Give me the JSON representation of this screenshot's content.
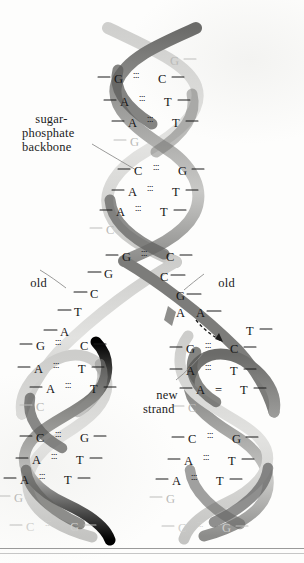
{
  "figure": {
    "type": "biology-diagram",
    "background_color": "#fdfdfc",
    "ink_color": "#161616"
  },
  "callouts": [
    {
      "id": "sugar-phosphate-backbone",
      "text": "sugar-\nphosphate\nbackbone",
      "x": 22,
      "y": 104
    },
    {
      "id": "old-left",
      "text": "old",
      "x": 17,
      "y": 268
    },
    {
      "id": "old-right",
      "text": "old",
      "x": 205,
      "y": 268
    },
    {
      "id": "new-strand",
      "text": "new\nstrand",
      "x": 143,
      "y": 381
    }
  ],
  "strands": {
    "light_label": "old strand (light ribbon)",
    "dark_label": "old strand (dark ribbon)",
    "light_color": "#c8c8c6",
    "dark_color": "#6e6e6c",
    "mid_color": "#9a9a98",
    "new_color": "#8a8a88"
  },
  "parent_duplex": {
    "region": "unreplicated double helix (top)",
    "pairs": [
      {
        "left": "",
        "right": "G",
        "y": 62,
        "bond": "dots",
        "style": "faded"
      },
      {
        "left": "G",
        "right": "C",
        "y": 80,
        "bond": "dots",
        "style": "normal"
      },
      {
        "left": "A",
        "right": "T",
        "y": 103,
        "bond": "dots",
        "style": "normal"
      },
      {
        "left": "A",
        "right": "T",
        "y": 124,
        "bond": "dots",
        "style": "normal"
      },
      {
        "left": "G",
        "right": "",
        "y": 143,
        "bond": "none",
        "style": "faded"
      },
      {
        "left": "C",
        "right": "G",
        "y": 172,
        "bond": "dots",
        "style": "normal"
      },
      {
        "left": "A",
        "right": "T",
        "y": 193,
        "bond": "dots",
        "style": "normal"
      },
      {
        "left": "A",
        "right": "T",
        "y": 213,
        "bond": "dots",
        "style": "normal"
      },
      {
        "left": "C",
        "right": "",
        "y": 231,
        "bond": "none",
        "style": "faded"
      },
      {
        "left": "G",
        "right": "C",
        "y": 258,
        "bond": "dots",
        "style": "normal"
      }
    ]
  },
  "unwound_left": {
    "region": "unwound template strand (left, old)",
    "bases": [
      {
        "base": "G",
        "y": 275
      },
      {
        "base": "C",
        "y": 295
      },
      {
        "base": "T",
        "y": 313
      },
      {
        "base": "A",
        "y": 333
      }
    ]
  },
  "unwound_right": {
    "region": "unwound template strand (right, old)",
    "bases": [
      {
        "base": "C",
        "y": 278
      },
      {
        "base": "G",
        "y": 297
      },
      {
        "base": "A",
        "y": 314
      }
    ]
  },
  "free_nucleotide": {
    "base": "A",
    "label": "free nucleotide being added",
    "x": 196,
    "y": 314,
    "arrow": "dashed-curved-arrow"
  },
  "daughter_left": {
    "region": "left daughter duplex",
    "pairs": [
      {
        "left": "G",
        "right": "C",
        "y": 347,
        "bond": "dots",
        "style": "normal"
      },
      {
        "left": "A",
        "right": "T",
        "y": 370,
        "bond": "dots",
        "style": "normal"
      },
      {
        "left": "A",
        "right": "T",
        "y": 390,
        "bond": "dots",
        "style": "normal"
      },
      {
        "left": "C",
        "right": "",
        "y": 408,
        "bond": "none",
        "style": "faded"
      },
      {
        "left": "C",
        "right": "G",
        "y": 439,
        "bond": "dots",
        "style": "normal"
      },
      {
        "left": "A",
        "right": "T",
        "y": 461,
        "bond": "dots",
        "style": "normal"
      },
      {
        "left": "A",
        "right": "T",
        "y": 481,
        "bond": "dots",
        "style": "normal"
      },
      {
        "left": "G",
        "right": "",
        "y": 499,
        "bond": "none",
        "style": "faded"
      },
      {
        "left": "C",
        "right": "G",
        "y": 528,
        "bond": "dots",
        "style": "faded2"
      }
    ]
  },
  "daughter_right": {
    "region": "right daughter duplex",
    "pairs": [
      {
        "left": "",
        "right": "T",
        "y": 332,
        "bond": "none",
        "style": "normal"
      },
      {
        "left": "G",
        "right": "C",
        "y": 350,
        "bond": "dots",
        "style": "normal"
      },
      {
        "left": "A",
        "right": "T",
        "y": 372,
        "bond": "dots",
        "style": "normal"
      },
      {
        "left": "A",
        "right": "T",
        "y": 391,
        "bond": "solid",
        "style": "normal"
      },
      {
        "left": "C",
        "right": "",
        "y": 409,
        "bond": "none",
        "style": "faded"
      },
      {
        "left": "C",
        "right": "G",
        "y": 440,
        "bond": "dots",
        "style": "normal"
      },
      {
        "left": "A",
        "right": "T",
        "y": 462,
        "bond": "dots",
        "style": "normal"
      },
      {
        "left": "A",
        "right": "T",
        "y": 482,
        "bond": "dots",
        "style": "normal"
      },
      {
        "left": "G",
        "right": "",
        "y": 500,
        "bond": "none",
        "style": "faded"
      },
      {
        "left": "C",
        "right": "G",
        "y": 529,
        "bond": "dots",
        "style": "faded2"
      }
    ]
  },
  "footer_rules": [
    {
      "y": 548,
      "weight": "thick"
    },
    {
      "y": 553,
      "weight": "thin"
    }
  ]
}
